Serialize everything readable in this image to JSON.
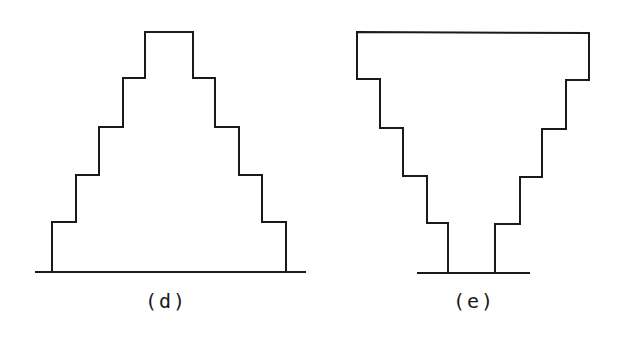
{
  "figures": [
    {
      "id": "d",
      "label": "(d)",
      "shape": "stepped-pyramid",
      "description": "Stepped profile widening toward the base (pyramid), 5 tiers",
      "tiers": 5,
      "label_pos": [
        166,
        308
      ],
      "ground": {
        "x1": 35,
        "x2": 306,
        "y": 272
      },
      "outline_points": [
        [
          52,
          272
        ],
        [
          52,
          222
        ],
        [
          76,
          222
        ],
        [
          76,
          175
        ],
        [
          99,
          175
        ],
        [
          99,
          127
        ],
        [
          123,
          127
        ],
        [
          123,
          78
        ],
        [
          145,
          78
        ],
        [
          145,
          32
        ],
        [
          193,
          32
        ],
        [
          193,
          78
        ],
        [
          215,
          78
        ],
        [
          215,
          127
        ],
        [
          239,
          127
        ],
        [
          239,
          175
        ],
        [
          262,
          175
        ],
        [
          262,
          222
        ],
        [
          286,
          222
        ],
        [
          286,
          272
        ]
      ]
    },
    {
      "id": "e",
      "label": "(e)",
      "shape": "inverted-stepped-pyramid",
      "description": "Stepped profile narrowing toward the base (inverted pyramid), 5 tiers",
      "tiers": 5,
      "label_pos": [
        474,
        308
      ],
      "ground": {
        "x1": 417,
        "x2": 530,
        "y": 273
      },
      "outline_points": [
        [
          448,
          273
        ],
        [
          448,
          223
        ],
        [
          427,
          223
        ],
        [
          427,
          176
        ],
        [
          403,
          176
        ],
        [
          403,
          128
        ],
        [
          380,
          128
        ],
        [
          380,
          79
        ],
        [
          357,
          79
        ],
        [
          357,
          32
        ],
        [
          589,
          33
        ],
        [
          589,
          80
        ],
        [
          566,
          80
        ],
        [
          566,
          129
        ],
        [
          542,
          129
        ],
        [
          542,
          177
        ],
        [
          520,
          177
        ],
        [
          520,
          224
        ],
        [
          495,
          224
        ],
        [
          495,
          273
        ]
      ]
    }
  ],
  "colors": {
    "stroke": "#1a1a1a",
    "background": "#ffffff"
  }
}
